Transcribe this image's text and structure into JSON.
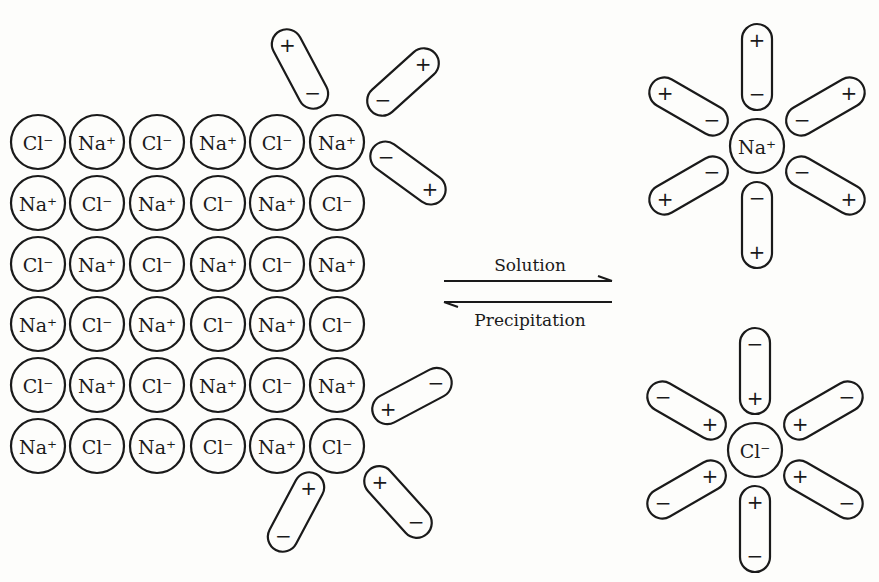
{
  "diagram": {
    "lattice": {
      "rows": [
        [
          "Cl⁻",
          "Na⁺",
          "Cl⁻",
          "Na⁺",
          "Cl⁻",
          "Na⁺"
        ],
        [
          "Na⁺",
          "Cl⁻",
          "Na⁺",
          "Cl⁻",
          "Na⁺",
          "Cl⁻"
        ],
        [
          "Cl⁻",
          "Na⁺",
          "Cl⁻",
          "Na⁺",
          "Cl⁻",
          "Na⁺"
        ],
        [
          "Na⁺",
          "Cl⁻",
          "Na⁺",
          "Cl⁻",
          "Na⁺",
          "Cl⁻"
        ],
        [
          "Cl⁻",
          "Na⁺",
          "Cl⁻",
          "Na⁺",
          "Cl⁻",
          "Na⁺"
        ],
        [
          "Na⁺",
          "Cl⁻",
          "Na⁺",
          "Cl⁻",
          "Na⁺",
          "Cl⁻"
        ]
      ]
    },
    "arrows": {
      "forward_label": "Solution",
      "reverse_label": "Precipitation"
    },
    "hydrated_cation": {
      "label": "Na⁺",
      "dipole_inner_pole": "−",
      "dipole_outer_pole": "+"
    },
    "hydrated_anion": {
      "label": "Cl⁻",
      "dipole_inner_pole": "+",
      "dipole_outer_pole": "−"
    },
    "symbols": {
      "plus": "+",
      "minus": "−"
    }
  }
}
